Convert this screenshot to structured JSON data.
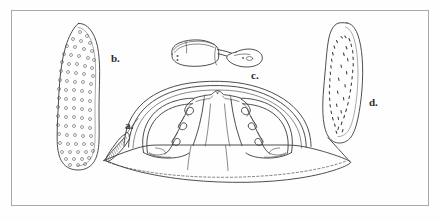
{
  "figure": {
    "title": "",
    "background_color": "#fefefe",
    "frame_color": "#a9a9a9",
    "ink_color": "#3a3a3a",
    "width": 441,
    "height": 220,
    "style": "scientific line drawing, pen and ink, monochrome"
  },
  "labels": {
    "a": "a.",
    "b": "b.",
    "c": "c.",
    "d": "d."
  },
  "specimens": [
    {
      "key": "a",
      "label": "a.",
      "name": "central-dome-specimen",
      "description": "Large bilaterally symmetric dome-shaped structure occupying the lower centre of the plate, with paired scalloped lateral ridges, a central median column, a broad flaring basal flange drawn with a dashed hidden margin, and a hatched serrated strip on the left edge to which the leader line of label a. points.",
      "position": {
        "x": 95,
        "y": 85,
        "width": 255,
        "height": 105
      },
      "label_position": {
        "x": 125,
        "y": 120
      }
    },
    {
      "key": "b",
      "label": "b.",
      "name": "porose-valve-specimen",
      "description": "Elongate club-shaped valve, broad and rounded at the base, tapering and pointed at the apex, its whole surface stippled with small ring-shaped pores arranged in loose longitudinal rows.",
      "position": {
        "x": 56,
        "y": 22,
        "width": 52,
        "height": 148
      },
      "label_position": {
        "x": 111,
        "y": 53
      }
    },
    {
      "key": "c",
      "label": "c.",
      "name": "stalked-appendage-specimen",
      "description": "Small horizontal element: an irregular rounded blade at the left bearing two dots, joined by a narrow tapering stalk to a rounded paddle-like terminal bearing a small loop at the right.",
      "position": {
        "x": 160,
        "y": 38,
        "width": 110,
        "height": 32
      },
      "label_position": {
        "x": 251,
        "y": 70
      }
    },
    {
      "key": "d",
      "label": "d.",
      "name": "striate-valve-specimen",
      "description": "Elongate club-shaped valve of similar outline to b., broadest and rounded below, pointed above, its surface marked with short dashes or striae rather than pores.",
      "position": {
        "x": 326,
        "y": 22,
        "width": 50,
        "height": 128
      },
      "label_position": {
        "x": 369,
        "y": 97
      }
    }
  ]
}
